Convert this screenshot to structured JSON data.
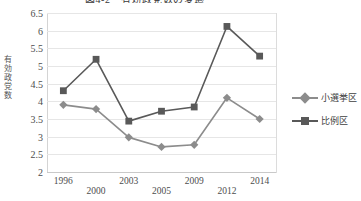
{
  "chart_data": {
    "type": "line",
    "title": "図4-2　有効政党数の変遷",
    "xlabel": "",
    "ylabel": "有効政党数",
    "ylabel_chars": [
      "有",
      "効",
      "政",
      "党",
      "数"
    ],
    "categories": [
      "1996",
      "2000",
      "2003",
      "2005",
      "2009",
      "2012",
      "2014"
    ],
    "ylim": [
      2,
      6.5
    ],
    "y_ticks": [
      "6.5",
      "6",
      "5.5",
      "5",
      "4.5",
      "4",
      "3.5",
      "3",
      "2.5",
      "2"
    ],
    "y_tick_values": [
      6.5,
      6,
      5.5,
      5,
      4.5,
      4,
      3.5,
      3,
      2.5,
      2
    ],
    "grid": true,
    "legend_position": "right",
    "series": [
      {
        "name": "小選挙区",
        "marker": "diamond",
        "color": "#8c8c8c",
        "values": [
          3.9,
          3.78,
          2.98,
          2.71,
          2.77,
          4.1,
          3.5
        ]
      },
      {
        "name": "比例区",
        "marker": "square",
        "color": "#595959",
        "values": [
          4.3,
          5.19,
          3.44,
          3.72,
          3.84,
          6.12,
          5.28
        ]
      }
    ]
  },
  "legend": {
    "items": [
      {
        "label": "小選挙区"
      },
      {
        "label": "比例区"
      }
    ]
  },
  "colors": {
    "series_small_district": "#8c8c8c",
    "series_proportional": "#595959",
    "gridline": "#e6e6e6",
    "axis": "#c9c9c9",
    "text": "#4d4d4d",
    "background": "#ffffff"
  }
}
